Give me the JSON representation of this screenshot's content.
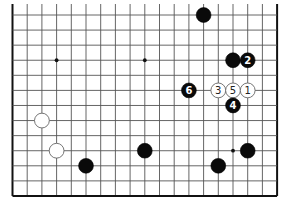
{
  "diagram": {
    "type": "go-board-fragment",
    "visible_columns": 19,
    "visible_rows": 13,
    "edges": {
      "left": true,
      "right": true,
      "bottom": true,
      "top": false
    },
    "hoshi": [
      {
        "col": 3,
        "row": 3
      },
      {
        "col": 9,
        "row": 3
      },
      {
        "col": 15,
        "row": 9
      }
    ],
    "stones": [
      {
        "color": "black",
        "col": 13,
        "row": 0,
        "label": ""
      },
      {
        "color": "black",
        "col": 15,
        "row": 3,
        "label": ""
      },
      {
        "color": "black",
        "col": 16,
        "row": 3,
        "label": "2"
      },
      {
        "color": "black",
        "col": 12,
        "row": 5,
        "label": "6"
      },
      {
        "color": "white",
        "col": 14,
        "row": 5,
        "label": "3"
      },
      {
        "color": "white",
        "col": 15,
        "row": 5,
        "label": "5"
      },
      {
        "color": "white",
        "col": 16,
        "row": 5,
        "label": "1"
      },
      {
        "color": "black",
        "col": 15,
        "row": 6,
        "label": "4"
      },
      {
        "color": "white",
        "col": 2,
        "row": 7,
        "label": ""
      },
      {
        "color": "white",
        "col": 3,
        "row": 9,
        "label": ""
      },
      {
        "color": "black",
        "col": 9,
        "row": 9,
        "label": ""
      },
      {
        "color": "black",
        "col": 16,
        "row": 9,
        "label": ""
      },
      {
        "color": "black",
        "col": 5,
        "row": 10,
        "label": ""
      },
      {
        "color": "black",
        "col": 14,
        "row": 10,
        "label": ""
      }
    ],
    "colors": {
      "black_stone": "#0a0a0a",
      "white_stone": "#ffffff",
      "line": "#555555"
    }
  }
}
